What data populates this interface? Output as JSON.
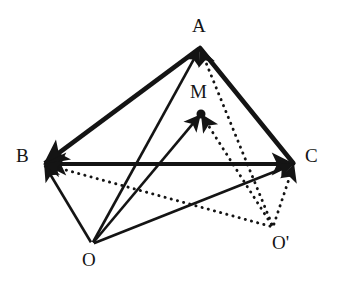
{
  "figure": {
    "kind": "geometry-vector-diagram",
    "width": 338,
    "height": 283,
    "background_color": "#ffffff",
    "ink_color": "#141414"
  },
  "labels": {
    "A": "A",
    "B": "B",
    "C": "C",
    "M": "M",
    "O": "O",
    "O_prime": "O'"
  },
  "points": {
    "A": {
      "name": "A",
      "x": 200,
      "y": 48,
      "label_x": 192,
      "label_y": 16
    },
    "B": {
      "name": "B",
      "x": 44,
      "y": 164,
      "label_x": 16,
      "label_y": 146
    },
    "C": {
      "name": "C",
      "x": 294,
      "y": 164,
      "label_x": 305,
      "label_y": 146
    },
    "M": {
      "name": "M",
      "x": 201,
      "y": 114,
      "label_x": 190,
      "label_y": 82
    },
    "O": {
      "name": "O",
      "x": 92,
      "y": 244,
      "label_x": 82,
      "label_y": 250
    },
    "O_prime": {
      "name": "O'",
      "x": 273,
      "y": 227,
      "label_x": 272,
      "label_y": 233
    }
  },
  "edges": [
    {
      "name": "edge-A-B",
      "from": "A",
      "to": "B",
      "style": "solid",
      "weight": "thick",
      "arrow_at": "to"
    },
    {
      "name": "edge-A-C",
      "from": "A",
      "to": "C",
      "style": "solid",
      "weight": "thick",
      "arrow_at": "none"
    },
    {
      "name": "edge-B-C",
      "from": "B",
      "to": "C",
      "style": "solid",
      "weight": "thick",
      "arrow_at": "both"
    }
  ],
  "vectors_from_O": [
    {
      "name": "vector-O-A",
      "from": "O",
      "to": "A",
      "style": "solid",
      "weight": "medium",
      "arrow_at": "to"
    },
    {
      "name": "vector-O-B",
      "from": "O",
      "to": "B",
      "style": "solid",
      "weight": "medium",
      "arrow_at": "to"
    },
    {
      "name": "vector-O-C",
      "from": "O",
      "to": "C",
      "style": "solid",
      "weight": "medium",
      "arrow_at": "to"
    },
    {
      "name": "vector-O-M",
      "from": "O",
      "to": "M",
      "style": "solid",
      "weight": "medium",
      "arrow_at": "to"
    }
  ],
  "vectors_from_O_prime": [
    {
      "name": "vector-Oprime-A",
      "from": "O_prime",
      "to": "A",
      "style": "dotted",
      "weight": "medium",
      "arrow_at": "to"
    },
    {
      "name": "vector-Oprime-B",
      "from": "O_prime",
      "to": "B",
      "style": "dotted",
      "weight": "medium",
      "arrow_at": "to"
    },
    {
      "name": "vector-Oprime-C",
      "from": "O_prime",
      "to": "C",
      "style": "dotted",
      "weight": "medium",
      "arrow_at": "to"
    },
    {
      "name": "vector-Oprime-M",
      "from": "O_prime",
      "to": "M",
      "style": "dotted",
      "weight": "medium",
      "arrow_at": "to"
    }
  ],
  "markers": [
    {
      "name": "point-dot-M",
      "at": "M",
      "radius": 4.5,
      "filled": true
    }
  ]
}
